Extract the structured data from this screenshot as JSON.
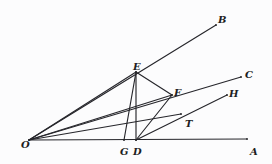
{
  "figure": {
    "kind": "geometry-diagram",
    "background_color": "#fcfcfd",
    "stroke_color": "#26262b",
    "label_color": "#1d1d22",
    "stroke_width": 1.15,
    "width": 272,
    "height": 164,
    "points": [
      {
        "id": "O",
        "label": "O",
        "x": 29,
        "y": 140,
        "label_x": 21,
        "label_y": 140
      },
      {
        "id": "A",
        "label": "A",
        "x": 247,
        "y": 139,
        "label_x": 250,
        "label_y": 147
      },
      {
        "id": "B",
        "label": "B",
        "x": 216,
        "y": 25,
        "label_x": 218,
        "label_y": 15
      },
      {
        "id": "C",
        "label": "C",
        "x": 241,
        "y": 77,
        "label_x": 245,
        "label_y": 70
      },
      {
        "id": "D",
        "label": "D",
        "x": 136,
        "y": 140,
        "label_x": 133,
        "label_y": 147
      },
      {
        "id": "E",
        "label": "E",
        "x": 136,
        "y": 72,
        "label_x": 133,
        "label_y": 62
      },
      {
        "id": "F",
        "label": "F",
        "x": 172,
        "y": 95,
        "label_x": 174,
        "label_y": 88
      },
      {
        "id": "G",
        "label": "G",
        "x": 124,
        "y": 140,
        "label_x": 120,
        "label_y": 147
      },
      {
        "id": "H",
        "label": "H",
        "x": 227,
        "y": 95,
        "label_x": 229,
        "label_y": 89
      },
      {
        "id": "T",
        "label": "T",
        "x": 181,
        "y": 114,
        "label_x": 185,
        "label_y": 119
      }
    ],
    "segments": [
      {
        "id": "ray-OA",
        "name": "ray-o-a",
        "from": "O",
        "to": "A"
      },
      {
        "id": "ray-OB",
        "name": "ray-o-b",
        "from": "O",
        "to": "B"
      },
      {
        "id": "ray-OC",
        "name": "ray-o-c",
        "from": "O",
        "to": "C"
      },
      {
        "id": "seg-ED",
        "name": "segment-e-d",
        "from": "E",
        "to": "D"
      },
      {
        "id": "seg-EF",
        "name": "segment-e-f",
        "from": "E",
        "to": "F"
      },
      {
        "id": "seg-EG",
        "name": "segment-e-g",
        "from": "E",
        "to": "G"
      },
      {
        "id": "seg-DF",
        "name": "segment-d-f",
        "from": "D",
        "to": "F"
      },
      {
        "id": "seg-DH",
        "name": "segment-d-h",
        "from": "D",
        "to": "H"
      },
      {
        "id": "seg-OF",
        "name": "segment-o-f",
        "from": "O",
        "to": "F"
      },
      {
        "id": "seg-OT",
        "name": "segment-o-t",
        "from": "O",
        "to": "T"
      },
      {
        "id": "seg-OE",
        "name": "segment-o-e",
        "from": "O",
        "to": "E"
      }
    ]
  }
}
